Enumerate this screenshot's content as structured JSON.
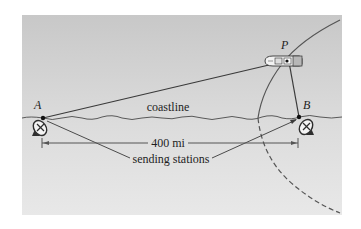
{
  "diagram": {
    "points": {
      "A": {
        "label": "A",
        "x": 43,
        "y": 118
      },
      "B": {
        "label": "B",
        "x": 299,
        "y": 117
      },
      "P": {
        "label": "P",
        "x": 287,
        "y": 60
      }
    },
    "labels": {
      "coastline": "coastline",
      "distance": "400 mi",
      "stations": "sending stations"
    },
    "icons": {
      "station_a": "radar-dish-icon",
      "station_b": "radar-dish-icon",
      "ship": "ship-icon"
    },
    "colors": {
      "panel_top": "#c9c9c9",
      "panel_bottom": "#e6e6e6",
      "line": "#3a3a3a",
      "text": "#1e1e1e"
    }
  }
}
